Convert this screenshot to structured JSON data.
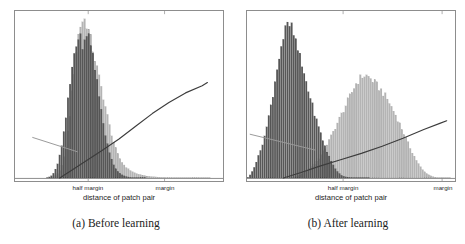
{
  "figure": {
    "background_color": "#ffffff",
    "frame_color": "#8d8d8d",
    "panels": [
      {
        "id": "panel-a",
        "caption": "(a) Before learning",
        "axis_title": "distance of patch pair",
        "tick_labels": [
          {
            "text": "half margin",
            "x_frac": 0.352
          },
          {
            "text": "margin",
            "x_frac": 0.719
          }
        ]
      },
      {
        "id": "panel-b",
        "caption": "(b) After learning",
        "axis_title": "distance of patch pair",
        "tick_labels": [
          {
            "text": "half margin",
            "x_frac": 0.462
          },
          {
            "text": "margin",
            "x_frac": 0.938
          }
        ]
      }
    ]
  },
  "chart_data": [
    {
      "type": "bar",
      "id": "panel-a-histogram",
      "title": "(a) Before learning",
      "xlabel": "distance of patch pair",
      "ylabel": "",
      "grid": false,
      "legend_position": "none",
      "xlim": [
        0,
        1
      ],
      "ylim": [
        0,
        1
      ],
      "xtick_positions": [
        0.352,
        0.719
      ],
      "xtick_labels": [
        "half margin",
        "margin"
      ],
      "bin_count": 100,
      "colors": {
        "similar_pairs": "#575757",
        "dissimilar_pairs": "#b4b4b4",
        "loss_curve": "#3c3c3c",
        "margin_line": "#9a9a9a"
      },
      "series": [
        {
          "name": "similar pairs (dark)",
          "color": "#575757",
          "x": [
            0.0,
            0.01,
            0.02,
            0.03,
            0.04,
            0.05,
            0.06,
            0.07,
            0.08,
            0.09,
            0.1,
            0.11,
            0.12,
            0.13,
            0.14,
            0.15,
            0.16,
            0.17,
            0.18,
            0.19,
            0.2,
            0.21,
            0.22,
            0.23,
            0.24,
            0.25,
            0.26,
            0.27,
            0.28,
            0.29,
            0.3,
            0.31,
            0.32,
            0.33,
            0.34,
            0.35,
            0.36,
            0.37,
            0.38,
            0.39,
            0.4,
            0.41,
            0.42,
            0.43,
            0.44,
            0.45,
            0.46,
            0.47,
            0.48,
            0.49,
            0.5,
            0.51,
            0.52,
            0.53,
            0.54,
            0.55,
            0.56,
            0.57,
            0.58,
            0.59,
            0.6,
            0.62,
            0.64,
            0.66,
            0.68,
            0.7,
            0.75,
            0.8,
            0.9,
            1.0
          ],
          "values": [
            0.0,
            0.0,
            0.0,
            0.0,
            0.0,
            0.0,
            0.0,
            0.0,
            0.0,
            0.0,
            0.0,
            0.0,
            0.0,
            0.0,
            0.0,
            0.0,
            0.005,
            0.01,
            0.02,
            0.04,
            0.07,
            0.11,
            0.17,
            0.24,
            0.33,
            0.43,
            0.54,
            0.65,
            0.74,
            0.82,
            0.87,
            0.885,
            0.86,
            0.83,
            0.86,
            0.9,
            0.88,
            0.82,
            0.74,
            0.65,
            0.56,
            0.47,
            0.39,
            0.31,
            0.24,
            0.18,
            0.135,
            0.1,
            0.07,
            0.05,
            0.035,
            0.025,
            0.017,
            0.012,
            0.008,
            0.006,
            0.004,
            0.003,
            0.002,
            0.0015,
            0.001,
            0.0008,
            0.0005,
            0.0003,
            0.0002,
            0.0001,
            5e-05,
            2e-05,
            1e-05,
            0.0
          ]
        },
        {
          "name": "dissimilar pairs (light)",
          "color": "#b4b4b4",
          "x": [
            0.0,
            0.01,
            0.02,
            0.03,
            0.04,
            0.05,
            0.06,
            0.07,
            0.08,
            0.09,
            0.1,
            0.11,
            0.12,
            0.13,
            0.14,
            0.15,
            0.16,
            0.17,
            0.18,
            0.19,
            0.2,
            0.21,
            0.22,
            0.23,
            0.24,
            0.25,
            0.26,
            0.27,
            0.28,
            0.29,
            0.3,
            0.31,
            0.32,
            0.33,
            0.34,
            0.35,
            0.36,
            0.37,
            0.38,
            0.39,
            0.4,
            0.41,
            0.42,
            0.43,
            0.44,
            0.45,
            0.46,
            0.47,
            0.48,
            0.49,
            0.5,
            0.51,
            0.52,
            0.53,
            0.54,
            0.55,
            0.56,
            0.57,
            0.58,
            0.59,
            0.6,
            0.62,
            0.64,
            0.66,
            0.68,
            0.7,
            0.75,
            0.8,
            0.9,
            1.0
          ],
          "values": [
            0.0,
            0.0,
            0.0,
            0.0,
            0.0,
            0.0,
            0.0,
            0.0,
            0.0,
            0.0,
            0.0,
            0.0,
            0.0,
            0.0,
            0.0,
            0.0,
            0.0,
            0.0,
            0.005,
            0.01,
            0.02,
            0.035,
            0.06,
            0.1,
            0.16,
            0.24,
            0.34,
            0.46,
            0.6,
            0.74,
            0.86,
            0.94,
            0.98,
            1.0,
            0.99,
            0.95,
            0.9,
            0.84,
            0.78,
            0.72,
            0.66,
            0.6,
            0.54,
            0.48,
            0.42,
            0.36,
            0.3,
            0.25,
            0.205,
            0.165,
            0.135,
            0.11,
            0.09,
            0.075,
            0.062,
            0.052,
            0.044,
            0.037,
            0.031,
            0.026,
            0.022,
            0.016,
            0.012,
            0.009,
            0.007,
            0.005,
            0.003,
            0.002,
            0.0008,
            0.0003
          ]
        }
      ],
      "lines": [
        {
          "name": "loss-curve",
          "color": "#3c3c3c",
          "points": [
            [
              0.215,
              0.0
            ],
            [
              0.28,
              0.055
            ],
            [
              0.35,
              0.115
            ],
            [
              0.42,
              0.175
            ],
            [
              0.5,
              0.245
            ],
            [
              0.58,
              0.325
            ],
            [
              0.66,
              0.405
            ],
            [
              0.74,
              0.475
            ],
            [
              0.82,
              0.535
            ],
            [
              0.9,
              0.58
            ],
            [
              0.925,
              0.6
            ]
          ]
        },
        {
          "name": "margin-line",
          "color": "#9a9a9a",
          "points": [
            [
              0.085,
              0.255
            ],
            [
              0.3,
              0.165
            ]
          ]
        }
      ]
    },
    {
      "type": "bar",
      "id": "panel-b-histogram",
      "title": "(b) After learning",
      "xlabel": "distance of patch pair",
      "ylabel": "",
      "grid": false,
      "legend_position": "none",
      "xlim": [
        0,
        1
      ],
      "ylim": [
        0,
        1
      ],
      "xtick_positions": [
        0.462,
        0.938
      ],
      "xtick_labels": [
        "half margin",
        "margin"
      ],
      "bin_count": 100,
      "colors": {
        "similar_pairs": "#575757",
        "dissimilar_pairs": "#b4b4b4",
        "loss_curve": "#3c3c3c",
        "margin_line": "#9a9a9a"
      },
      "series": [
        {
          "name": "similar pairs (dark)",
          "color": "#575757",
          "x": [
            0.0,
            0.01,
            0.02,
            0.03,
            0.04,
            0.05,
            0.06,
            0.07,
            0.08,
            0.09,
            0.1,
            0.11,
            0.12,
            0.13,
            0.14,
            0.15,
            0.16,
            0.17,
            0.18,
            0.19,
            0.2,
            0.21,
            0.22,
            0.23,
            0.24,
            0.25,
            0.26,
            0.27,
            0.28,
            0.29,
            0.3,
            0.31,
            0.32,
            0.33,
            0.34,
            0.35,
            0.36,
            0.37,
            0.38,
            0.39,
            0.4,
            0.41,
            0.42,
            0.43,
            0.44,
            0.45,
            0.46,
            0.48,
            0.5,
            0.55,
            0.6,
            0.7,
            0.8,
            1.0
          ],
          "values": [
            0.0,
            0.01,
            0.03,
            0.055,
            0.085,
            0.12,
            0.155,
            0.195,
            0.24,
            0.29,
            0.35,
            0.42,
            0.49,
            0.57,
            0.65,
            0.73,
            0.8,
            0.86,
            0.91,
            0.945,
            0.965,
            0.955,
            0.925,
            0.88,
            0.83,
            0.78,
            0.73,
            0.68,
            0.63,
            0.58,
            0.53,
            0.48,
            0.43,
            0.385,
            0.34,
            0.3,
            0.26,
            0.22,
            0.185,
            0.15,
            0.12,
            0.095,
            0.07,
            0.05,
            0.035,
            0.022,
            0.013,
            0.006,
            0.003,
            0.001,
            0.0005,
            0.0002,
            0.0001,
            0.0
          ]
        },
        {
          "name": "dissimilar pairs (light)",
          "color": "#b4b4b4",
          "x": [
            0.2,
            0.22,
            0.24,
            0.26,
            0.28,
            0.3,
            0.32,
            0.34,
            0.36,
            0.38,
            0.4,
            0.42,
            0.44,
            0.46,
            0.48,
            0.5,
            0.51,
            0.52,
            0.53,
            0.54,
            0.55,
            0.56,
            0.57,
            0.58,
            0.59,
            0.6,
            0.61,
            0.62,
            0.63,
            0.64,
            0.65,
            0.66,
            0.67,
            0.68,
            0.69,
            0.7,
            0.71,
            0.72,
            0.73,
            0.74,
            0.75,
            0.76,
            0.77,
            0.78,
            0.79,
            0.8,
            0.81,
            0.82,
            0.83,
            0.84,
            0.85,
            0.86,
            0.88,
            0.9,
            0.92,
            0.95,
            1.0
          ],
          "values": [
            0.0,
            0.005,
            0.012,
            0.022,
            0.035,
            0.055,
            0.08,
            0.115,
            0.155,
            0.2,
            0.25,
            0.305,
            0.36,
            0.415,
            0.47,
            0.525,
            0.555,
            0.585,
            0.605,
            0.62,
            0.635,
            0.645,
            0.645,
            0.64,
            0.63,
            0.62,
            0.605,
            0.59,
            0.575,
            0.56,
            0.545,
            0.525,
            0.505,
            0.485,
            0.46,
            0.435,
            0.41,
            0.385,
            0.355,
            0.325,
            0.295,
            0.265,
            0.235,
            0.205,
            0.175,
            0.15,
            0.125,
            0.1,
            0.08,
            0.06,
            0.045,
            0.032,
            0.016,
            0.007,
            0.003,
            0.001,
            0.0003
          ]
        }
      ],
      "lines": [
        {
          "name": "loss-curve",
          "color": "#3c3c3c",
          "points": [
            [
              0.175,
              0.0
            ],
            [
              0.26,
              0.035
            ],
            [
              0.35,
              0.075
            ],
            [
              0.45,
              0.115
            ],
            [
              0.55,
              0.155
            ],
            [
              0.65,
              0.2
            ],
            [
              0.75,
              0.25
            ],
            [
              0.85,
              0.305
            ],
            [
              0.93,
              0.345
            ],
            [
              0.96,
              0.36
            ]
          ]
        },
        {
          "name": "margin-line",
          "color": "#9a9a9a",
          "points": [
            [
              0.015,
              0.275
            ],
            [
              0.33,
              0.175
            ]
          ]
        }
      ]
    }
  ]
}
